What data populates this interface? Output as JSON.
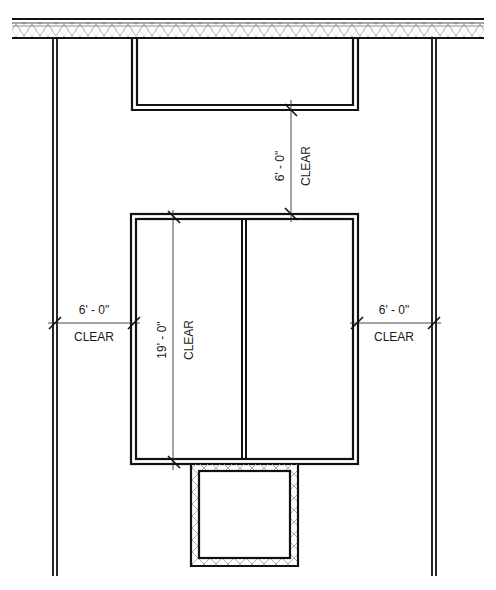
{
  "drawing": {
    "type": "architectural floor plan",
    "colors": {
      "line": "#111111",
      "hatch": "#9a9a9a",
      "background": "#ffffff"
    }
  },
  "dimensions": {
    "top_gap": {
      "value": "6' - 0\"",
      "note": "CLEAR"
    },
    "left_gap": {
      "value": "6' - 0\"",
      "note": "CLEAR"
    },
    "right_gap": {
      "value": "6' - 0\"",
      "note": "CLEAR"
    },
    "block_length": {
      "value": "19' - 0\"",
      "note": "CLEAR"
    }
  }
}
